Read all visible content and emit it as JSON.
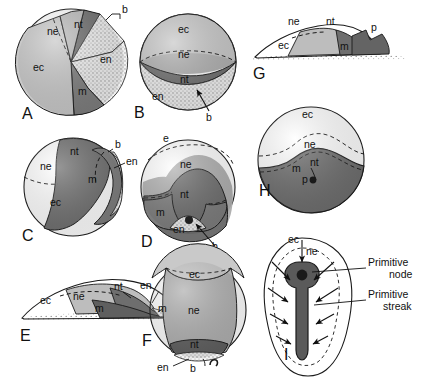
{
  "figure": {
    "background_color": "#ffffff",
    "abbreviation_key": {
      "ec": "ectoderm",
      "ne": "neuroectoderm",
      "nt": "notochord",
      "m": "mesoderm",
      "en": "endoderm",
      "b": "blastopore",
      "p": "primitive streak",
      "e": "epiblast"
    },
    "colors": {
      "ectoderm": "#c9c9c9",
      "neuroectoderm": "#b3b3b3",
      "notochord": "#6e6e6e",
      "mesoderm": "#7d7d7d",
      "endoderm": "#ececec",
      "stipple": "#d8d8d8",
      "outline": "#1a1a1a",
      "text": "#111111"
    }
  },
  "panels": [
    {
      "id": "A",
      "letter": "A",
      "view": "sphere-sector-fate-map",
      "labels": [
        {
          "key": "ne",
          "text": "ne"
        },
        {
          "key": "nt",
          "text": "nt"
        },
        {
          "key": "b",
          "text": "b"
        },
        {
          "key": "en",
          "text": "en"
        },
        {
          "key": "ec",
          "text": "ec"
        },
        {
          "key": "m",
          "text": "m"
        }
      ]
    },
    {
      "id": "B",
      "letter": "B",
      "view": "sphere-banded-fate-map",
      "labels": [
        {
          "key": "ec",
          "text": "ec"
        },
        {
          "key": "ne",
          "text": "ne"
        },
        {
          "key": "nt",
          "text": "nt"
        },
        {
          "key": "en",
          "text": "en"
        },
        {
          "key": "b",
          "text": "b"
        }
      ]
    },
    {
      "id": "C",
      "letter": "C",
      "view": "sphere-lateral-fate-map",
      "labels": [
        {
          "key": "nt",
          "text": "nt"
        },
        {
          "key": "b",
          "text": "b"
        },
        {
          "key": "en",
          "text": "en"
        },
        {
          "key": "ne",
          "text": "ne"
        },
        {
          "key": "m",
          "text": "m"
        },
        {
          "key": "ec",
          "text": "ec"
        }
      ]
    },
    {
      "id": "D",
      "letter": "D",
      "view": "sphere-dorsal-fate-map",
      "labels": [
        {
          "key": "e",
          "text": "e"
        },
        {
          "key": "ne",
          "text": "ne"
        },
        {
          "key": "nt",
          "text": "nt"
        },
        {
          "key": "m",
          "text": "m"
        },
        {
          "key": "en",
          "text": "en"
        },
        {
          "key": "b",
          "text": "b"
        }
      ]
    },
    {
      "id": "E",
      "letter": "E",
      "view": "flat-profile-disc",
      "labels": [
        {
          "key": "ec",
          "text": "ec"
        },
        {
          "key": "ne",
          "text": "ne"
        },
        {
          "key": "nt",
          "text": "nt"
        },
        {
          "key": "en",
          "text": "en"
        },
        {
          "key": "b",
          "text": "b"
        },
        {
          "key": "m",
          "text": "m"
        }
      ]
    },
    {
      "id": "F",
      "letter": "F",
      "view": "sphere-ventral-fate-map",
      "labels": [
        {
          "key": "ec",
          "text": "ec"
        },
        {
          "key": "ne",
          "text": "ne"
        },
        {
          "key": "m",
          "text": "m"
        },
        {
          "key": "nt",
          "text": "nt"
        },
        {
          "key": "en",
          "text": "en"
        },
        {
          "key": "b",
          "text": "b"
        }
      ]
    },
    {
      "id": "G",
      "letter": "G",
      "view": "flat-profile-disc-primitive-streak",
      "labels": [
        {
          "key": "ne",
          "text": "ne"
        },
        {
          "key": "nt",
          "text": "nt"
        },
        {
          "key": "p",
          "text": "p"
        },
        {
          "key": "ec",
          "text": "ec"
        },
        {
          "key": "m",
          "text": "m"
        }
      ]
    },
    {
      "id": "H",
      "letter": "H",
      "view": "sphere-primitive-streak-section",
      "labels": [
        {
          "key": "ec",
          "text": "ec"
        },
        {
          "key": "ne",
          "text": "ne"
        },
        {
          "key": "m",
          "text": "m"
        },
        {
          "key": "nt",
          "text": "nt"
        },
        {
          "key": "p",
          "text": "p"
        }
      ]
    },
    {
      "id": "I",
      "letter": "I",
      "view": "pear-shaped-surface-view",
      "labels": [
        {
          "key": "ec",
          "text": "ec"
        },
        {
          "key": "ne",
          "text": "ne"
        }
      ],
      "callouts": [
        {
          "key": "primitive-node",
          "text": "Primitive\nnode",
          "line1": "Primitive",
          "line2": "node"
        },
        {
          "key": "primitive-streak",
          "text": "Primitive\nstreak",
          "line1": "Primitive",
          "line2": "streak"
        }
      ]
    }
  ]
}
